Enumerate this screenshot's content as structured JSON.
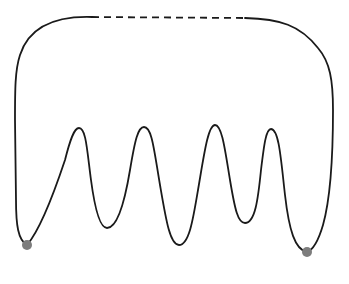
{
  "diagram": {
    "colors": {
      "line": "#1a1a1a",
      "marker": "#7d7d7d",
      "background": "#ffffff"
    },
    "peaks": [
      {
        "x": 79,
        "y": 128
      },
      {
        "x": 144,
        "y": 127
      },
      {
        "x": 215,
        "y": 125
      },
      {
        "x": 271,
        "y": 129
      }
    ],
    "valleys": [
      {
        "x": 107,
        "y": 228
      },
      {
        "x": 179,
        "y": 245
      },
      {
        "x": 245,
        "y": 223
      }
    ],
    "markers": [
      {
        "name": "left-minimum-dot",
        "x": 27,
        "y": 245,
        "r": 5
      },
      {
        "name": "right-minimum-dot",
        "x": 307,
        "y": 252,
        "r": 5
      }
    ],
    "dashed_segment": {
      "x1": 92,
      "y1": 17,
      "x2": 245,
      "y2": 18
    }
  }
}
